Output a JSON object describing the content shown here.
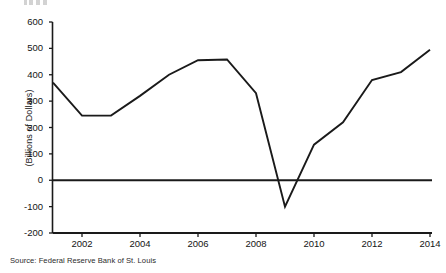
{
  "chart_data": {
    "type": "line",
    "title": "",
    "subtitle": "",
    "xlabel": "",
    "ylabel": "(Billions of Dollars)",
    "xlim": [
      2001,
      2014
    ],
    "ylim": [
      -200,
      600
    ],
    "grid": false,
    "legend": null,
    "zero_line": true,
    "x": [
      2001,
      2002,
      2003,
      2004,
      2005,
      2006,
      2007,
      2008,
      2009,
      2010,
      2011,
      2012,
      2013,
      2014
    ],
    "values": [
      370,
      245,
      245,
      320,
      400,
      455,
      458,
      330,
      -100,
      135,
      220,
      380,
      410,
      495
    ],
    "series": [
      {
        "name": "Federal Surplus or Deficit",
        "values": [
          370,
          245,
          245,
          320,
          400,
          455,
          458,
          330,
          -100,
          135,
          220,
          380,
          410,
          495
        ]
      }
    ],
    "ytick_labels": [
      "600",
      "500",
      "400",
      "300",
      "200",
      "100",
      "0",
      "-100",
      "-200"
    ],
    "ytick_values": [
      600,
      500,
      400,
      300,
      200,
      100,
      0,
      -100,
      -200
    ],
    "xtick_labels": [
      "2002",
      "2004",
      "2006",
      "2008",
      "2010",
      "2012",
      "2014"
    ],
    "xtick_values": [
      2002,
      2004,
      2006,
      2008,
      2010,
      2012,
      2014
    ],
    "line_color": "#1a1a1a",
    "axis_color": "#1a1a1a",
    "background_color": "#ffffff"
  },
  "source": {
    "note": "Source: Federal Reserve Bank of St. Louis"
  }
}
